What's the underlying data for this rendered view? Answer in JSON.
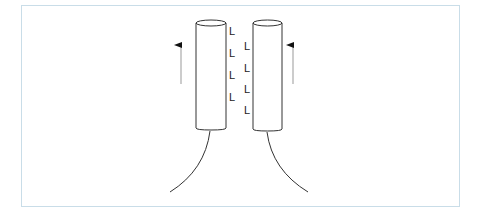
{
  "diagram": {
    "frame_color": "#c9dde8",
    "stroke_color": "#333333",
    "cylinders": [
      {
        "name": "left",
        "x": 196,
        "width": 30,
        "top": 23,
        "bottom": 130
      },
      {
        "name": "right",
        "x": 253,
        "width": 29,
        "top": 23,
        "bottom": 130
      }
    ],
    "left_labels": [
      "L",
      "L",
      "L",
      "L"
    ],
    "right_labels": [
      "L",
      "L",
      "L",
      "L",
      "L"
    ],
    "arrows": [
      {
        "name": "left-arrow",
        "direction": "up"
      },
      {
        "name": "right-arrow",
        "direction": "up"
      }
    ]
  }
}
